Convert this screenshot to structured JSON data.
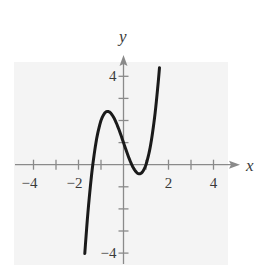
{
  "chart_data": {
    "type": "line",
    "title": "",
    "xlabel": "x",
    "ylabel": "y",
    "xlim": [
      -4.4,
      4.6
    ],
    "ylim": [
      -4.4,
      4.8
    ],
    "xticks": [
      -4,
      -3,
      -2,
      -1,
      0,
      1,
      2,
      3,
      4
    ],
    "yticks": [
      -4,
      -3,
      -2,
      -1,
      1,
      2,
      3,
      4
    ],
    "xtick_labels": [
      {
        "value": -4,
        "label": "−4"
      },
      {
        "value": -2,
        "label": "−2"
      },
      {
        "value": 2,
        "label": "2"
      },
      {
        "value": 4,
        "label": "4"
      }
    ],
    "ytick_labels": [
      {
        "value": 4,
        "label": "4"
      },
      {
        "value": -4,
        "label": "−4"
      }
    ],
    "grid": false,
    "legend": null,
    "series": [
      {
        "name": "f(x)",
        "description": "cubic curve with local max near (-0.7, 2.4) and local min near (0.7, -0.4)",
        "x": [
          -1.72,
          -1.6,
          -1.4,
          -1.2,
          -1.0,
          -0.8,
          -0.707,
          -0.6,
          -0.4,
          -0.2,
          0.0,
          0.2,
          0.4,
          0.6,
          0.707,
          0.8,
          1.0,
          1.2,
          1.4,
          1.6
        ],
        "y": [
          -4.02,
          -2.39,
          -0.29,
          1.14,
          2.0,
          2.38,
          2.41,
          2.37,
          2.07,
          1.58,
          1.0,
          0.42,
          -0.07,
          -0.37,
          -0.41,
          -0.38,
          0.0,
          0.86,
          2.29,
          4.39
        ]
      }
    ]
  },
  "labels": {
    "x_axis": "x",
    "y_axis": "y"
  }
}
